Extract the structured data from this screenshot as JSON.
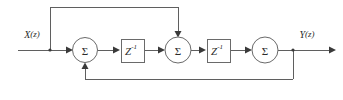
{
  "figure": {
    "kind": "signal-flow-block-diagram",
    "title": "",
    "width": 343,
    "height": 100,
    "background_color": "#ffffff",
    "line_color": "#5f5f5f",
    "text_color": "#2b2b2b"
  },
  "ports": {
    "input": {
      "label": "X(z)",
      "label_base": "X",
      "label_arg": "(z)",
      "x": 32,
      "y": 34
    },
    "output": {
      "label": "Y(z)",
      "label_base": "Y",
      "label_arg": "(z)",
      "x": 307,
      "y": 34
    }
  },
  "nodes": {
    "summers": [
      {
        "id": "sum-1",
        "label": "Σ",
        "cx": 85,
        "cy": 50,
        "r": 12.5
      },
      {
        "id": "sum-2",
        "label": "Σ",
        "cx": 178,
        "cy": 50,
        "r": 13
      },
      {
        "id": "sum-3",
        "label": "Σ",
        "cx": 265,
        "cy": 50,
        "r": 13
      }
    ],
    "delays": [
      {
        "id": "delay-1",
        "label": "Z",
        "exponent": "-1",
        "x": 121,
        "y": 39,
        "w": 23,
        "h": 23
      },
      {
        "id": "delay-2",
        "label": "Z",
        "exponent": "-1",
        "x": 207,
        "y": 39,
        "w": 23,
        "h": 23
      }
    ]
  },
  "paths": {
    "main_line_y": 50,
    "input_start_x": 18,
    "output_end_x": 336,
    "feedforward": {
      "tap_x": 50,
      "top_y": 7,
      "drop_x": 178
    },
    "feedback": {
      "tap_x": 293,
      "bottom_y": 79,
      "rise_x": 85
    }
  }
}
